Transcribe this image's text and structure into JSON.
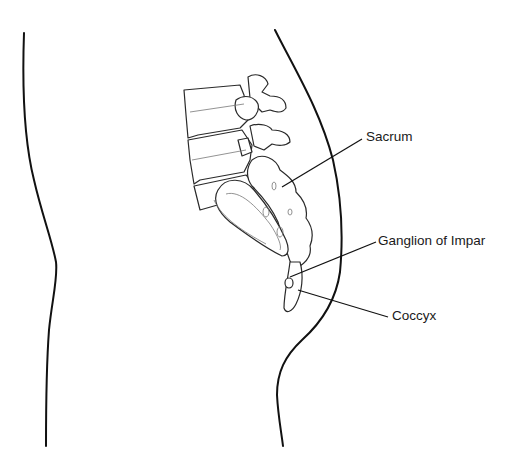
{
  "diagram": {
    "type": "anatomical-illustration",
    "labels": [
      {
        "id": "sacrum",
        "text": "Sacrum",
        "x": 366,
        "y": 131,
        "leader": {
          "x1": 282,
          "y1": 187,
          "x2": 362,
          "y2": 139
        }
      },
      {
        "id": "ganglion",
        "text": "Ganglion of Impar",
        "x": 378,
        "y": 235,
        "leader": {
          "x1": 290,
          "y1": 277,
          "x2": 376,
          "y2": 242
        }
      },
      {
        "id": "coccyx",
        "text": "Coccyx",
        "x": 392,
        "y": 310,
        "leader": {
          "x1": 298,
          "y1": 290,
          "x2": 388,
          "y2": 317
        }
      }
    ],
    "colors": {
      "background": "#ffffff",
      "line": "#111111",
      "text": "#1a1a1a"
    }
  }
}
